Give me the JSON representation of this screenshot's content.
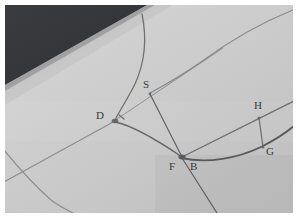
{
  "scene": {
    "title": "hand-drawn-geometry-photo",
    "description": "Photograph of a pencil geometric construction on light gray paper with a dark background visible at the upper-left corner",
    "medium": "photograph-of-paper-drawing"
  },
  "colors": {
    "frame": "#ffffff",
    "paper_light": "#d6d6d6",
    "paper_mid": "#c9c9c9",
    "paper_shadow": "#bdbdbd",
    "dark_background": "#333539",
    "dark_background_edge": "#3d4044",
    "pencil_line": "#6d6e70",
    "pencil_line_strong": "#58595b",
    "pencil_line_faint": "#8b8c8e",
    "label_text": "#3a3a3a"
  },
  "frame": {
    "outer_width": 298,
    "outer_height": 218,
    "border_px": 5,
    "photo_width": 288,
    "photo_height": 208
  },
  "labels": [
    {
      "id": "D",
      "text": "D",
      "x": 96,
      "y": 114,
      "name": "point-label-d"
    },
    {
      "id": "S",
      "text": "S",
      "x": 142,
      "y": 88,
      "name": "point-label-s"
    },
    {
      "id": "H",
      "text": "H",
      "x": 253,
      "y": 108,
      "name": "point-label-h"
    },
    {
      "id": "G",
      "text": "G",
      "x": 265,
      "y": 154,
      "name": "point-label-g"
    },
    {
      "id": "F",
      "text": "F",
      "x": 168,
      "y": 169,
      "name": "point-label-f"
    },
    {
      "id": "B",
      "text": "B",
      "x": 189,
      "y": 169,
      "name": "point-label-b"
    }
  ],
  "points": [
    {
      "id": "D",
      "x": 110,
      "y": 120
    },
    {
      "id": "S",
      "x": 149,
      "y": 93
    },
    {
      "id": "F",
      "x": 177,
      "y": 158
    },
    {
      "id": "B",
      "x": 186,
      "y": 157
    },
    {
      "id": "H",
      "x": 258,
      "y": 117
    },
    {
      "id": "G",
      "x": 262,
      "y": 146
    }
  ],
  "strokes": [
    {
      "name": "curve-top-through-d",
      "description": "long pencil arc entering from top edge, bending left down to vertex D",
      "path": "M 137,14 C 142,38 140,62 130,84 C 122,100 115,110 110,120",
      "width": 1.3,
      "color": "#70716f"
    },
    {
      "name": "line-d-lower-left",
      "description": "straight pencil line from D down-left off the lower-left edge",
      "path": "M 110,121 L 4,182",
      "width": 1.1,
      "color": "#8a8b8c"
    },
    {
      "name": "curve-d-to-f",
      "description": "arc from vertex D sweeping down-right to vertex F/B",
      "path": "M 110,122 C 130,126 155,142 177,157",
      "width": 1.4,
      "color": "#65666a"
    },
    {
      "name": "line-s-through-d",
      "description": "faint straight line from S continuing down-left past D toward the left edge",
      "path": "M 218,48 L 110,120",
      "width": 1.0,
      "color": "#8f9092"
    },
    {
      "name": "curve-upper-right-diagonal",
      "description": "long faint arc from top-right corner down to S and beyond",
      "path": "M 292,10 C 262,22 230,40 200,62 C 180,76 162,86 149,93",
      "width": 1.1,
      "color": "#85868a"
    },
    {
      "name": "line-s-to-f",
      "description": "straight segment from S down to vertex F",
      "path": "M 149,94 L 177,157",
      "width": 1.2,
      "color": "#5f6063"
    },
    {
      "name": "line-f-extended-down",
      "description": "continuation of S-F line below F toward the lower edge",
      "path": "M 177,158 L 214,212",
      "width": 1.2,
      "color": "#5f6063"
    },
    {
      "name": "curve-b-to-right-edge",
      "description": "dark curve from B bending right and up through G to the right edge",
      "path": "M 178,158 C 205,164 235,158 258,147 C 272,140 284,132 293,126",
      "width": 1.8,
      "color": "#58595b"
    },
    {
      "name": "line-b-through-h",
      "description": "straight line from B up-right through H continuing to the right edge",
      "path": "M 179,157 L 293,101",
      "width": 1.2,
      "color": "#6c6d70"
    },
    {
      "name": "segment-h-g",
      "description": "short segment joining H on the line down to G on the curve",
      "path": "M 258,117 L 262,146",
      "width": 1.2,
      "color": "#6a6b6e"
    },
    {
      "name": "curve-bottom-left",
      "description": "faint arc entering at the bottom-left corner",
      "path": "M 4,150 C 16,166 32,184 50,200 C 58,206 66,210 72,212",
      "width": 1.2,
      "color": "#8d8e90"
    },
    {
      "name": "angle-tick-at-d",
      "description": "small pencil tick mark just right of vertex D",
      "path": "M 117,115 L 121,118",
      "width": 1.2,
      "color": "#6d6e70"
    }
  ]
}
